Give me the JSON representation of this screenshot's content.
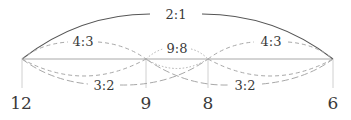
{
  "diagram": {
    "nodes": [
      {
        "id": "n12",
        "label": "12",
        "x": 22
      },
      {
        "id": "n9",
        "label": "9",
        "x": 146
      },
      {
        "id": "n8",
        "label": "8",
        "x": 208
      },
      {
        "id": "n6",
        "label": "6",
        "x": 333
      }
    ],
    "ratios": {
      "octave": "2:1",
      "fourth_left": "4:3",
      "fourth_right": "4:3",
      "tone": "9:8",
      "fifth_left": "3:2",
      "fifth_right": "3:2"
    },
    "colors": {
      "solid_line": "#555555",
      "dashed_line": "#a8a8a8",
      "baseline": "#b0b0b0",
      "text": "#3a3a3a"
    }
  }
}
